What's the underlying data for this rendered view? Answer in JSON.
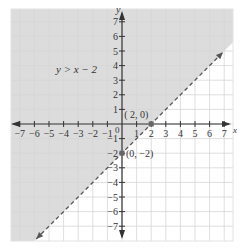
{
  "chart_data": {
    "type": "area",
    "title": "",
    "xlabel": "x",
    "ylabel": "y",
    "xlim": [
      -7.5,
      7.5
    ],
    "ylim": [
      -7.5,
      7.5
    ],
    "grid": true,
    "x_ticks": [
      -7,
      -6,
      -5,
      -4,
      -3,
      -2,
      -1,
      1,
      2,
      3,
      4,
      5,
      6,
      7
    ],
    "y_ticks": [
      7,
      6,
      5,
      4,
      3,
      2,
      1,
      -1,
      -2,
      -3,
      -4,
      -5,
      -6,
      -7
    ],
    "origin_label": "0",
    "boundary": {
      "equation": "y = x - 2",
      "style": "dashed",
      "slope": 1,
      "intercept": -2
    },
    "shaded_region": "above line",
    "inequality_label": "y > x − 2",
    "points": [
      {
        "x": 2,
        "y": 0,
        "label": "( 2, 0)"
      },
      {
        "x": 0,
        "y": -2,
        "label": "(0, −2)"
      }
    ],
    "colors": {
      "shade": "#dcdcdc",
      "grid": "#d6d6d6",
      "axis": "#333333",
      "line": "#555555"
    }
  }
}
